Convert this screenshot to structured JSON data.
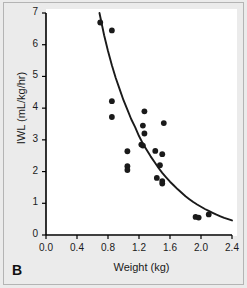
{
  "figure": {
    "panel_label": "B",
    "background_color": "#ebebeb",
    "plot_background_color": "#ffffff",
    "marker_color": "#1a1a1a",
    "curve_color": "#1a1a1a",
    "axis_color": "#000000"
  },
  "chart_data": {
    "type": "scatter",
    "title": "",
    "subtitle": "",
    "xlabel": "Weight (kg)",
    "ylabel": "IWL (mL/kg/hr)",
    "xlim": [
      0.0,
      2.4
    ],
    "ylim": [
      0,
      7
    ],
    "xticks": [
      "0.0",
      "0.4",
      "0.8",
      "1.2",
      "1.6",
      "2.0",
      "2.4"
    ],
    "xtick_values": [
      0.0,
      0.4,
      0.8,
      1.2,
      1.6,
      2.0,
      2.4
    ],
    "yticks": [
      "0",
      "1",
      "2",
      "3",
      "4",
      "5",
      "6",
      "7"
    ],
    "ytick_values": [
      0,
      1,
      2,
      3,
      4,
      5,
      6,
      7
    ],
    "grid": false,
    "legend": null,
    "annotations": [
      "B"
    ],
    "series": [
      {
        "name": "IWL measurements",
        "type": "scatter",
        "marker": "circle",
        "color": "#1a1a1a",
        "points": [
          {
            "x": 0.7,
            "y": 6.7
          },
          {
            "x": 0.85,
            "y": 6.45
          },
          {
            "x": 0.85,
            "y": 4.22
          },
          {
            "x": 0.85,
            "y": 3.72
          },
          {
            "x": 1.05,
            "y": 2.64
          },
          {
            "x": 1.05,
            "y": 2.17
          },
          {
            "x": 1.05,
            "y": 2.05
          },
          {
            "x": 1.27,
            "y": 3.9
          },
          {
            "x": 1.25,
            "y": 3.45
          },
          {
            "x": 1.27,
            "y": 3.2
          },
          {
            "x": 1.23,
            "y": 2.85
          },
          {
            "x": 1.25,
            "y": 2.82
          },
          {
            "x": 1.41,
            "y": 2.65
          },
          {
            "x": 1.52,
            "y": 3.53
          },
          {
            "x": 1.5,
            "y": 2.55
          },
          {
            "x": 1.47,
            "y": 2.2
          },
          {
            "x": 1.43,
            "y": 1.8
          },
          {
            "x": 1.5,
            "y": 1.7
          },
          {
            "x": 1.5,
            "y": 1.62
          },
          {
            "x": 1.93,
            "y": 0.57
          },
          {
            "x": 1.97,
            "y": 0.55
          },
          {
            "x": 2.1,
            "y": 0.65
          }
        ]
      },
      {
        "name": "Fitted exponential decay curve",
        "type": "line",
        "color": "#1a1a1a",
        "points": [
          {
            "x": 0.69,
            "y": 7.0
          },
          {
            "x": 0.75,
            "y": 6.3
          },
          {
            "x": 0.8,
            "y": 5.8
          },
          {
            "x": 0.85,
            "y": 5.35
          },
          {
            "x": 0.9,
            "y": 4.95
          },
          {
            "x": 0.95,
            "y": 4.6
          },
          {
            "x": 1.0,
            "y": 4.25
          },
          {
            "x": 1.05,
            "y": 3.95
          },
          {
            "x": 1.1,
            "y": 3.65
          },
          {
            "x": 1.15,
            "y": 3.4
          },
          {
            "x": 1.2,
            "y": 3.12
          },
          {
            "x": 1.25,
            "y": 2.88
          },
          {
            "x": 1.3,
            "y": 2.68
          },
          {
            "x": 1.35,
            "y": 2.48
          },
          {
            "x": 1.4,
            "y": 2.3
          },
          {
            "x": 1.45,
            "y": 2.12
          },
          {
            "x": 1.5,
            "y": 1.96
          },
          {
            "x": 1.55,
            "y": 1.82
          },
          {
            "x": 1.6,
            "y": 1.68
          },
          {
            "x": 1.65,
            "y": 1.56
          },
          {
            "x": 1.7,
            "y": 1.44
          },
          {
            "x": 1.75,
            "y": 1.33
          },
          {
            "x": 1.8,
            "y": 1.22
          },
          {
            "x": 1.85,
            "y": 1.13
          },
          {
            "x": 1.9,
            "y": 1.04
          },
          {
            "x": 1.95,
            "y": 0.96
          },
          {
            "x": 2.0,
            "y": 0.89
          },
          {
            "x": 2.05,
            "y": 0.82
          },
          {
            "x": 2.1,
            "y": 0.76
          },
          {
            "x": 2.15,
            "y": 0.7
          },
          {
            "x": 2.2,
            "y": 0.64
          },
          {
            "x": 2.25,
            "y": 0.59
          },
          {
            "x": 2.3,
            "y": 0.54
          },
          {
            "x": 2.35,
            "y": 0.5
          },
          {
            "x": 2.4,
            "y": 0.46
          }
        ]
      }
    ]
  }
}
